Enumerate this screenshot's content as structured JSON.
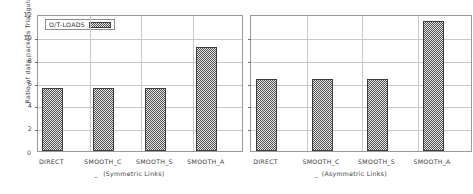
{
  "chart_data": {
    "type": "bar",
    "title": "",
    "xlabel": "",
    "ylabel": "Ratio of data packets Triangulated (%)",
    "ylim": [
      0,
      12
    ],
    "yticks": [
      0,
      2,
      4,
      6,
      8,
      10,
      12
    ],
    "ytick_labels": [
      "0",
      "2",
      "4",
      "6",
      "8",
      "10",
      "12"
    ],
    "grid": true,
    "legend": {
      "position": "top-left",
      "entries": [
        {
          "name": "O/T-LOADS",
          "fill": "checkerboard",
          "color": "#4f4f4f"
        }
      ]
    },
    "panels": [
      {
        "name": "symmetric",
        "group_label": "(Symmetric Links)",
        "categories": [
          "DIRECT",
          "SMOOTH_C",
          "SMOOTH_S",
          "SMOOTH_A"
        ],
        "series": [
          {
            "name": "O/T-LOADS",
            "values": [
              5.55,
              5.55,
              5.55,
              9.15
            ]
          }
        ]
      },
      {
        "name": "asymmetric",
        "group_label": "(Asymmetric Links)",
        "categories": [
          "DIRECT",
          "SMOOTH_C",
          "SMOOTH_S",
          "SMOOTH_A"
        ],
        "series": [
          {
            "name": "O/T-LOADS",
            "values": [
              6.3,
              6.3,
              6.3,
              11.4
            ]
          }
        ]
      }
    ]
  },
  "axis": {
    "zero_label": "0",
    "dash_mark": "_"
  }
}
